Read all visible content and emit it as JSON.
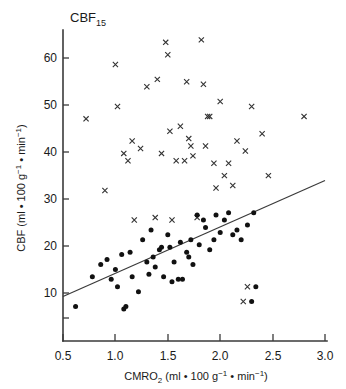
{
  "figure": {
    "title": "CBF",
    "title_sub": "15",
    "y_axis": {
      "label_main": "CBF (ml ",
      "label_bullet1": "•",
      "label_mid": " 100 g",
      "label_sup1": "−1",
      "label_bullet2": " • ",
      "label_end": "min",
      "label_sup2": "−1",
      "label_close": ")",
      "ticks": [
        "10",
        "20",
        "30",
        "40",
        "50",
        "60"
      ],
      "range": [
        5,
        68
      ]
    },
    "x_axis": {
      "label_main": "CMRO",
      "label_sub": "2",
      "label_rest": " (ml ",
      "label_bullet1": "•",
      "label_mid": " 100 g",
      "label_sup1": "−1",
      "label_bullet2": " • ",
      "label_end": "min",
      "label_sup2": "−1",
      "label_close": ")",
      "ticks": [
        "0.5",
        "1.0",
        "1.5",
        "2.0",
        "2.5",
        "3.0"
      ],
      "range": [
        0.5,
        3.0
      ]
    }
  },
  "chart_data": {
    "type": "scatter",
    "title": "CBF15",
    "xlabel": "CMRO2 (ml • 100 g⁻¹ • min⁻¹)",
    "ylabel": "CBF (ml • 100 g⁻¹ • min⁻¹)",
    "xlim": [
      0.5,
      3.0
    ],
    "ylim": [
      5,
      68
    ],
    "grid": false,
    "legend": "none",
    "series": [
      {
        "name": "CBF15 (cross markers)",
        "marker": "x",
        "color": "#333333",
        "points": [
          [
            0.72,
            50.0
          ],
          [
            0.9,
            35.5
          ],
          [
            1.0,
            61.0
          ],
          [
            1.02,
            52.5
          ],
          [
            1.08,
            43.0
          ],
          [
            1.12,
            41.5
          ],
          [
            1.16,
            45.5
          ],
          [
            1.18,
            29.5
          ],
          [
            1.24,
            44.0
          ],
          [
            1.3,
            56.5
          ],
          [
            1.38,
            30.0
          ],
          [
            1.4,
            58.0
          ],
          [
            1.44,
            43.0
          ],
          [
            1.48,
            65.5
          ],
          [
            1.5,
            63.0
          ],
          [
            1.52,
            47.5
          ],
          [
            1.54,
            29.5
          ],
          [
            1.58,
            41.5
          ],
          [
            1.62,
            48.5
          ],
          [
            1.66,
            41.5
          ],
          [
            1.68,
            57.5
          ],
          [
            1.7,
            46.0
          ],
          [
            1.72,
            44.5
          ],
          [
            1.74,
            42.5
          ],
          [
            1.78,
            30.0
          ],
          [
            1.82,
            66.0
          ],
          [
            1.84,
            57.0
          ],
          [
            1.86,
            44.5
          ],
          [
            1.9,
            50.5
          ],
          [
            1.94,
            41.0
          ],
          [
            1.96,
            36.0
          ],
          [
            2.0,
            53.5
          ],
          [
            2.04,
            38.5
          ],
          [
            2.08,
            41.0
          ],
          [
            2.12,
            36.5
          ],
          [
            2.16,
            45.5
          ],
          [
            2.24,
            43.5
          ],
          [
            2.26,
            16.0
          ],
          [
            2.3,
            52.5
          ],
          [
            2.4,
            47.0
          ],
          [
            2.46,
            38.5
          ],
          [
            2.8,
            50.5
          ],
          [
            1.88,
            50.5
          ],
          [
            2.22,
            13.0
          ]
        ]
      },
      {
        "name": "CBF (filled-circle markers)",
        "marker": "o",
        "color": "#111111",
        "points": [
          [
            0.62,
            12.0
          ],
          [
            0.78,
            18.0
          ],
          [
            0.86,
            20.5
          ],
          [
            0.92,
            21.5
          ],
          [
            0.96,
            17.5
          ],
          [
            1.0,
            19.5
          ],
          [
            1.02,
            16.0
          ],
          [
            1.06,
            22.5
          ],
          [
            1.08,
            11.5
          ],
          [
            1.1,
            12.0
          ],
          [
            1.14,
            23.0
          ],
          [
            1.16,
            18.0
          ],
          [
            1.22,
            15.0
          ],
          [
            1.26,
            25.5
          ],
          [
            1.3,
            21.0
          ],
          [
            1.34,
            27.5
          ],
          [
            1.36,
            22.0
          ],
          [
            1.38,
            20.0
          ],
          [
            1.42,
            23.5
          ],
          [
            1.44,
            24.0
          ],
          [
            1.46,
            18.0
          ],
          [
            1.5,
            26.5
          ],
          [
            1.52,
            24.0
          ],
          [
            1.56,
            21.0
          ],
          [
            1.6,
            17.5
          ],
          [
            1.62,
            25.0
          ],
          [
            1.64,
            17.5
          ],
          [
            1.68,
            23.0
          ],
          [
            1.7,
            22.0
          ],
          [
            1.72,
            25.5
          ],
          [
            1.74,
            20.5
          ],
          [
            1.78,
            30.5
          ],
          [
            1.8,
            24.5
          ],
          [
            1.84,
            29.5
          ],
          [
            1.86,
            28.0
          ],
          [
            1.9,
            23.5
          ],
          [
            1.94,
            25.5
          ],
          [
            1.96,
            30.5
          ],
          [
            2.0,
            27.0
          ],
          [
            2.04,
            29.5
          ],
          [
            2.08,
            31.0
          ],
          [
            2.12,
            26.5
          ],
          [
            2.16,
            27.5
          ],
          [
            2.2,
            25.5
          ],
          [
            2.26,
            28.5
          ],
          [
            2.32,
            31.0
          ],
          [
            2.34,
            16.0
          ],
          [
            2.3,
            13.0
          ],
          [
            1.32,
            18.5
          ],
          [
            1.54,
            17.0
          ]
        ]
      }
    ],
    "fit_line": {
      "name": "regression line",
      "x0": 0.5,
      "y0": 14.0,
      "x1": 3.0,
      "y1": 37.5
    }
  }
}
